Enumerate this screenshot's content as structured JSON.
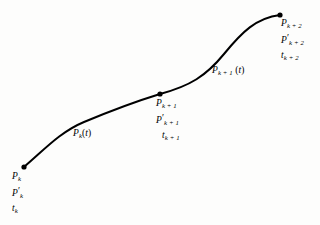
{
  "figure": {
    "background_color": "#fdfdfc",
    "stroke_color": "#000000",
    "stroke_width": 2.0,
    "knot_dot_color": "#000000",
    "knot_dot_radius": 2.6
  },
  "knots": [
    {
      "id": "k",
      "point_label": "P",
      "point_sub": "k",
      "derivative_label": "P",
      "derivative_sub": "k",
      "derivative_prime": "′",
      "parameter_label": "t",
      "parameter_sub": "k",
      "x": 24,
      "y": 167
    },
    {
      "id": "k1",
      "point_label": "P",
      "point_sub": "k + 1",
      "derivative_label": "P",
      "derivative_sub": "k + 1",
      "derivative_prime": "′",
      "parameter_label": "t",
      "parameter_sub": "k + 1",
      "x": 160,
      "y": 94
    },
    {
      "id": "k2",
      "point_label": "P",
      "point_sub": "k + 2",
      "derivative_label": "P",
      "derivative_sub": "k + 2",
      "derivative_prime": "′",
      "parameter_label": "t",
      "parameter_sub": "k + 2",
      "x": 280,
      "y": 15
    }
  ],
  "segments": [
    {
      "id": "seg-k",
      "label": "P",
      "sub": "k",
      "argument": "(t)",
      "open_paren": "(",
      "var": "t",
      "close_paren": ")",
      "path": "M 24,167 C 44,150 60,132 84,122 C 108,112 134,102 160,94"
    },
    {
      "id": "seg-k1",
      "label": "P",
      "sub": "k + 1",
      "argument": "(t)",
      "open_paren": "(",
      "var": "t",
      "close_paren": ")",
      "path": "M 160,94 C 190,86 206,76 224,54 C 242,32 256,18 280,15"
    }
  ],
  "chart_data": {
    "type": "line",
    "xlabel": "",
    "ylabel": "",
    "xlim": [
      0,
      320
    ],
    "ylim": [
      225,
      0
    ],
    "grid": false,
    "legend": "none",
    "annotations": [
      "P_k, P'_k, t_k",
      "P_k(t)",
      "P_k+1, P'_k+1, t_k+1",
      "P_k+1(t)",
      "P_k+2, P'_k+2, t_k+2"
    ],
    "series": [
      {
        "name": "P_k(t)",
        "x": [
          24,
          44,
          60,
          84,
          108,
          134,
          160
        ],
        "y": [
          167,
          150,
          132,
          122,
          112,
          102,
          94
        ]
      },
      {
        "name": "P_k+1(t)",
        "x": [
          160,
          190,
          206,
          224,
          242,
          256,
          280
        ],
        "y": [
          94,
          86,
          76,
          54,
          32,
          18,
          15
        ]
      }
    ],
    "markers": [
      {
        "label": "P_k",
        "x": 24,
        "y": 167
      },
      {
        "label": "P_k+1",
        "x": 160,
        "y": 94
      },
      {
        "label": "P_k+2",
        "x": 280,
        "y": 15
      }
    ]
  }
}
